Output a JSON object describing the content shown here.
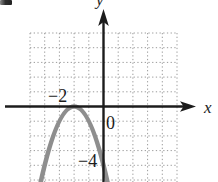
{
  "figure": {
    "background": "#ffffff",
    "axis_labels": {
      "x": "x",
      "y": "y"
    },
    "tick_labels": {
      "x_neg2": "−2",
      "origin": "0",
      "y_neg4": "−4"
    },
    "colors": {
      "curve": "#8e8e8e",
      "axes": "#1c1c1c",
      "grid": "#9b9b9b",
      "text": "#1c1c1c"
    },
    "artifacts": [
      "cropped-ink-mark-top-left"
    ]
  },
  "chart_data": {
    "type": "line",
    "title": "",
    "xlabel": "x",
    "ylabel": "y",
    "equation": "y = -(x + 2)^2",
    "series": [
      {
        "name": "parabola",
        "form": "vertex",
        "a": -1,
        "h": -2,
        "k": 0,
        "points": [
          [
            -4,
            -4
          ],
          [
            -3,
            -1
          ],
          [
            -2,
            0
          ],
          [
            -1,
            -1
          ],
          [
            0,
            -4
          ]
        ]
      }
    ],
    "key_points": {
      "vertex": [
        -2,
        0
      ]
    },
    "x_ticks_labeled": [
      -2
    ],
    "y_ticks_labeled": [
      -4
    ],
    "origin_label": 0,
    "grid": true,
    "grid_cell": 1,
    "xlim": [
      -5,
      5.2
    ],
    "ylim": [
      -5.3,
      5
    ],
    "legend": false
  }
}
